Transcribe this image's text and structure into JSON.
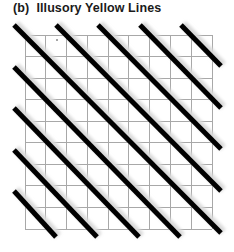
{
  "figure": {
    "panel_label": "(b)",
    "title": "Illusory Yellow Lines",
    "title_full": "(b)  Illusory Yellow Lines"
  },
  "grid": {
    "columns": 9,
    "rows": 9,
    "x0": 25,
    "y0": 35,
    "x1": 212,
    "y1": 229,
    "line_color": "#a8a8a8",
    "line_width": 1
  },
  "diagonals": {
    "color": "#000000",
    "shadow_color": "#d9d9d9",
    "width": 5,
    "segments": [
      {
        "x1": 181,
        "y1": 25,
        "x2": 221,
        "y2": 66
      },
      {
        "x1": 140,
        "y1": 25,
        "x2": 221,
        "y2": 108
      },
      {
        "x1": 98,
        "y1": 25,
        "x2": 221,
        "y2": 149
      },
      {
        "x1": 56,
        "y1": 25,
        "x2": 221,
        "y2": 191
      },
      {
        "x1": 14,
        "y1": 25,
        "x2": 221,
        "y2": 233
      },
      {
        "x1": 14,
        "y1": 67,
        "x2": 180,
        "y2": 237
      },
      {
        "x1": 14,
        "y1": 108,
        "x2": 139,
        "y2": 237
      },
      {
        "x1": 14,
        "y1": 150,
        "x2": 97,
        "y2": 237
      },
      {
        "x1": 14,
        "y1": 191,
        "x2": 56,
        "y2": 237
      }
    ]
  },
  "artifacts": {
    "dot": {
      "x": 57,
      "y": 40,
      "r": 0.8,
      "color": "#333333"
    }
  }
}
